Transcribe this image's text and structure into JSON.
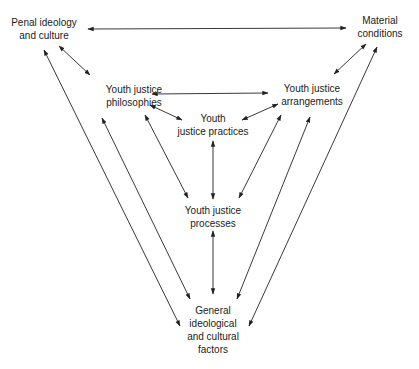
{
  "diagram": {
    "nodes": {
      "penal": {
        "lines": [
          "Penal ideology",
          "and culture"
        ],
        "x": 44,
        "y": 16
      },
      "material": {
        "lines": [
          "Material",
          "conditions"
        ],
        "x": 380,
        "y": 14
      },
      "philosophies": {
        "lines": [
          "Youth justice",
          "philosophies"
        ],
        "x": 134,
        "y": 83
      },
      "arrangements": {
        "lines": [
          "Youth justice",
          "arrangements"
        ],
        "x": 312,
        "y": 82
      },
      "practices": {
        "lines": [
          "Youth",
          "justice practices"
        ],
        "x": 213,
        "y": 112
      },
      "processes": {
        "lines": [
          "Youth justice",
          "processes"
        ],
        "x": 213,
        "y": 204
      },
      "general": {
        "lines": [
          "General",
          "ideological",
          "and cultural",
          "factors"
        ],
        "x": 213,
        "y": 304
      }
    },
    "edges": [
      {
        "from": "penal",
        "to": "material",
        "x1": 88,
        "y1": 29,
        "x2": 346,
        "y2": 28
      },
      {
        "from": "penal",
        "to": "philosophies",
        "x1": 59,
        "y1": 46,
        "x2": 90,
        "y2": 75
      },
      {
        "from": "material",
        "to": "arrangements",
        "x1": 366,
        "y1": 44,
        "x2": 334,
        "y2": 74
      },
      {
        "from": "philosophies",
        "to": "arrangements",
        "x1": 152,
        "y1": 94,
        "x2": 268,
        "y2": 93
      },
      {
        "from": "philosophies",
        "to": "practices",
        "x1": 150,
        "y1": 105,
        "x2": 182,
        "y2": 120
      },
      {
        "from": "arrangements",
        "to": "practices",
        "x1": 278,
        "y1": 104,
        "x2": 242,
        "y2": 120
      },
      {
        "from": "practices",
        "to": "processes",
        "x1": 213,
        "y1": 141,
        "x2": 213,
        "y2": 199
      },
      {
        "from": "philosophies",
        "to": "processes",
        "x1": 145,
        "y1": 115,
        "x2": 188,
        "y2": 198
      },
      {
        "from": "arrangements",
        "to": "processes",
        "x1": 281,
        "y1": 115,
        "x2": 239,
        "y2": 198
      },
      {
        "from": "processes",
        "to": "general",
        "x1": 213,
        "y1": 231,
        "x2": 213,
        "y2": 294
      },
      {
        "from": "penal",
        "to": "general",
        "x1": 44,
        "y1": 50,
        "x2": 180,
        "y2": 326
      },
      {
        "from": "philosophies",
        "to": "general",
        "x1": 102,
        "y1": 118,
        "x2": 190,
        "y2": 299
      },
      {
        "from": "arrangements",
        "to": "general",
        "x1": 310,
        "y1": 117,
        "x2": 237,
        "y2": 299
      },
      {
        "from": "material",
        "to": "general",
        "x1": 377,
        "y1": 47,
        "x2": 249,
        "y2": 326
      }
    ],
    "edge_color": "#222222",
    "arrow_style": "bidirectional"
  }
}
